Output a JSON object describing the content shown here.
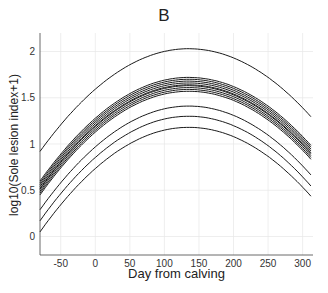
{
  "chart_data": {
    "type": "line",
    "title": "B",
    "xlabel": "Day from calving",
    "ylabel": "log10(Sole lesion index+1)",
    "xlim": [
      -80,
      315
    ],
    "ylim": [
      -0.2,
      2.2
    ],
    "xticks": [
      -50,
      0,
      50,
      100,
      150,
      200,
      250,
      300
    ],
    "yticks": [
      0,
      0.5,
      1,
      1.5,
      2
    ],
    "ytick_labels": [
      "0",
      "0.5",
      "1",
      "1.5",
      "2"
    ],
    "grid": true,
    "legend": null,
    "peak_day": 135,
    "series": [
      {
        "name": "curve-1",
        "left": 0.92,
        "peak": 2.03,
        "right": 1.27
      },
      {
        "name": "curve-2",
        "left": 0.6,
        "peak": 1.72,
        "right": 0.96
      },
      {
        "name": "curve-3",
        "left": 0.58,
        "peak": 1.7,
        "right": 0.94
      },
      {
        "name": "curve-4",
        "left": 0.56,
        "peak": 1.68,
        "right": 0.92
      },
      {
        "name": "curve-5",
        "left": 0.54,
        "peak": 1.66,
        "right": 0.9
      },
      {
        "name": "curve-6",
        "left": 0.52,
        "peak": 1.64,
        "right": 0.88
      },
      {
        "name": "curve-7",
        "left": 0.51,
        "peak": 1.63,
        "right": 0.87
      },
      {
        "name": "curve-8",
        "left": 0.49,
        "peak": 1.61,
        "right": 0.85
      },
      {
        "name": "curve-9",
        "left": 0.47,
        "peak": 1.59,
        "right": 0.83
      },
      {
        "name": "curve-10",
        "left": 0.45,
        "peak": 1.57,
        "right": 0.81
      },
      {
        "name": "curve-11",
        "left": 0.29,
        "peak": 1.41,
        "right": 0.64
      },
      {
        "name": "curve-12",
        "left": 0.17,
        "peak": 1.3,
        "right": 0.52
      },
      {
        "name": "curve-13",
        "left": 0.05,
        "peak": 1.18,
        "right": 0.41
      }
    ]
  }
}
